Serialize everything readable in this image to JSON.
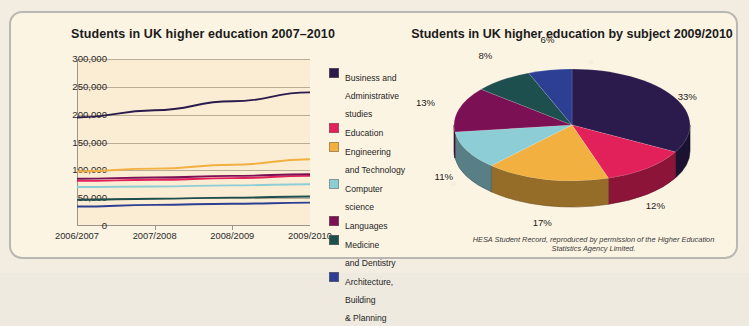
{
  "panel": {
    "background_color": "#fcf4e2",
    "border_color": "#b9b7b2"
  },
  "line_chart": {
    "title": "Students in UK higher education 2007–2010",
    "y_ticks": [
      "300,000",
      "250,000",
      "200,000",
      "150,000",
      "100,000",
      "50,000",
      "0"
    ],
    "x_ticks": [
      "2006/2007",
      "2007/2008",
      "2008/2009",
      "2009/2010"
    ]
  },
  "legend": {
    "items": [
      {
        "label": "Business and\nAdministrative\nstudies",
        "color": "#2b1b4d"
      },
      {
        "label": "Education",
        "color": "#e2215b"
      },
      {
        "label": "Engineering\nand Technology",
        "color": "#f2b040"
      },
      {
        "label": "Computer\nscience",
        "color": "#8ccdd6"
      },
      {
        "label": "Languages",
        "color": "#7b1055"
      },
      {
        "label": "Medicine\nand Dentistry",
        "color": "#1d4f4f"
      },
      {
        "label": "Architecture,\nBuilding\n& Planning",
        "color": "#2c3f93"
      }
    ]
  },
  "pie_chart": {
    "title": "Students in UK higher education by subject 2009/2010",
    "credit": "HESA Student Record, reproduced by permission\nof the Higher Education Statistics Agency Limited."
  },
  "chart_data": [
    {
      "type": "line",
      "title": "Students in UK higher education 2007–2010",
      "xlabel": "",
      "ylabel": "",
      "categories": [
        "2006/2007",
        "2007/2008",
        "2008/2009",
        "2009/2010"
      ],
      "ylim": [
        0,
        300000
      ],
      "ytick_step": 50000,
      "grid": true,
      "legend_position": "right",
      "series": [
        {
          "name": "Business and Administrative studies",
          "color": "#2b1b4d",
          "values": [
            195000,
            208000,
            224000,
            240000
          ]
        },
        {
          "name": "Education",
          "color": "#e2215b",
          "values": [
            81000,
            83000,
            86000,
            90000
          ]
        },
        {
          "name": "Engineering and Technology",
          "color": "#f2b040",
          "values": [
            98000,
            103000,
            110000,
            120000
          ]
        },
        {
          "name": "Computer science",
          "color": "#8ccdd6",
          "values": [
            70000,
            71000,
            73000,
            75000
          ]
        },
        {
          "name": "Languages",
          "color": "#7b1055",
          "values": [
            85000,
            87000,
            90000,
            93000
          ]
        },
        {
          "name": "Medicine and Dentistry",
          "color": "#1d4f4f",
          "values": [
            47000,
            49000,
            51000,
            53000
          ]
        },
        {
          "name": "Architecture, Building & Planning",
          "color": "#2c3f93",
          "values": [
            35000,
            38000,
            40000,
            42000
          ]
        }
      ]
    },
    {
      "type": "pie",
      "title": "Students in UK higher education by subject 2009/2010",
      "labels": [
        "Business and Administrative studies",
        "Education",
        "Engineering and Technology",
        "Computer science",
        "Languages",
        "Medicine and Dentistry",
        "Architecture, Building & Planning"
      ],
      "values": [
        33,
        12,
        17,
        11,
        13,
        8,
        6
      ],
      "value_labels": [
        "33%",
        "12%",
        "17%",
        "11%",
        "13%",
        "8%",
        "6%"
      ],
      "colors": [
        "#2b1b4d",
        "#e2215b",
        "#f2b040",
        "#8ccdd6",
        "#7b1055",
        "#1d4f4f",
        "#2c3f93"
      ],
      "annotation": "HESA Student Record, reproduced by permission of the Higher Education Statistics Agency Limited."
    }
  ]
}
